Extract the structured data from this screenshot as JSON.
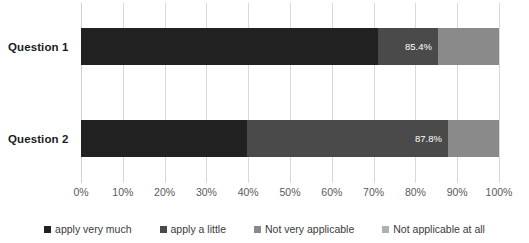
{
  "chart_data": {
    "type": "bar",
    "orientation": "horizontal",
    "stacked": true,
    "stack_mode": "percent",
    "title": "",
    "subtitle": "",
    "xlabel": "",
    "ylabel": "",
    "xlim": [
      0,
      100
    ],
    "grid": true,
    "grid_axis": "x",
    "legend_position": "bottom",
    "categories": [
      "Question 1",
      "Question 2"
    ],
    "tick_labels": [
      "0%",
      "10%",
      "20%",
      "30%",
      "40%",
      "50%",
      "60%",
      "70%",
      "80%",
      "90%",
      "100%"
    ],
    "tick_values": [
      0,
      10,
      20,
      30,
      40,
      50,
      60,
      70,
      80,
      90,
      100
    ],
    "series": [
      {
        "name": "apply very much",
        "color": "#212121",
        "values": [
          71.0,
          39.8
        ]
      },
      {
        "name": "apply a little",
        "color": "#4a4a4a",
        "values": [
          14.4,
          48.0
        ]
      },
      {
        "name": "Not very applicable",
        "color": "#8a8a8a",
        "values": [
          14.6,
          12.2
        ]
      },
      {
        "name": "Not applicable at all",
        "color": "#b0b0b0",
        "values": [
          0.0,
          0.0
        ]
      }
    ],
    "annotations": [
      {
        "text": "85.4%",
        "category": "Question 1",
        "series": "apply a little",
        "cumulative_value": 85.4
      },
      {
        "text": "87.8%",
        "category": "Question 2",
        "series": "apply a little",
        "cumulative_value": 87.8
      }
    ],
    "bar_labels": [
      [
        "",
        "85.4%",
        "",
        ""
      ],
      [
        "",
        "87.8%",
        "",
        ""
      ]
    ]
  },
  "colors": {
    "series_1": "#212121",
    "series_2": "#4a4a4a",
    "series_3": "#8a8a8a",
    "series_4": "#b0b0b0",
    "gridline": "#d9d9d9",
    "tick_text": "#5a5a5a",
    "category_text": "#1c1c1c",
    "legend_text": "#3a3a3a",
    "background": "#ffffff",
    "data_label_text": "#ffffff"
  }
}
